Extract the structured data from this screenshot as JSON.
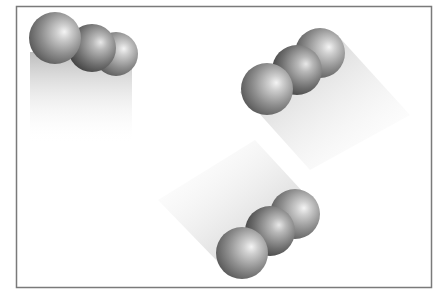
{
  "diagram": {
    "frame": {
      "x": 16,
      "y": 6,
      "width": 416,
      "height": 282,
      "stroke": "#7a7a7a"
    },
    "colors": {
      "sphere_light": "#f2f2f2",
      "sphere_mid": "#8c8c8c",
      "sphere_dark": "#3a3a3a",
      "shadow": "#bdbdbd",
      "background": "#ffffff"
    },
    "groups": [
      {
        "name": "top-left-cluster",
        "trail": "down",
        "spheres": [
          {
            "cx": 116,
            "cy": 54,
            "r": 22
          },
          {
            "cx": 92,
            "cy": 48,
            "r": 24
          },
          {
            "cx": 55,
            "cy": 38,
            "r": 26
          }
        ]
      },
      {
        "name": "top-right-cluster",
        "trail": "down-right",
        "spheres": [
          {
            "cx": 320,
            "cy": 53,
            "r": 25
          },
          {
            "cx": 297,
            "cy": 70,
            "r": 25
          },
          {
            "cx": 267,
            "cy": 89,
            "r": 26
          }
        ]
      },
      {
        "name": "bottom-center-cluster",
        "trail": "up-left",
        "spheres": [
          {
            "cx": 295,
            "cy": 214,
            "r": 25
          },
          {
            "cx": 270,
            "cy": 231,
            "r": 25
          },
          {
            "cx": 242,
            "cy": 253,
            "r": 26
          }
        ]
      }
    ]
  }
}
